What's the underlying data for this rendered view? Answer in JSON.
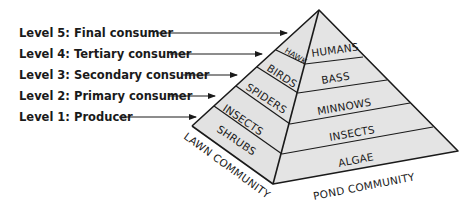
{
  "diagram": {
    "type": "energy-pyramid",
    "fill_color": "#e2e2e2",
    "line_color": "#1a1a1a",
    "levels": [
      {
        "label": "Level 5: Final consumer"
      },
      {
        "label": "Level 4: Tertiary consumer"
      },
      {
        "label": "Level 3: Secondary consumer"
      },
      {
        "label": "Level 2: Primary consumer"
      },
      {
        "label": "Level 1: Producer"
      }
    ],
    "lawn_community": {
      "label": "LAWN COMMUNITY",
      "organisms": [
        "HAWK",
        "BIRDS",
        "SPIDERS",
        "INSECTS",
        "SHRUBS"
      ]
    },
    "pond_community": {
      "label": "POND COMMUNITY",
      "organisms": [
        "HUMANS",
        "BASS",
        "MINNOWS",
        "INSECTS",
        "ALGAE"
      ]
    }
  }
}
